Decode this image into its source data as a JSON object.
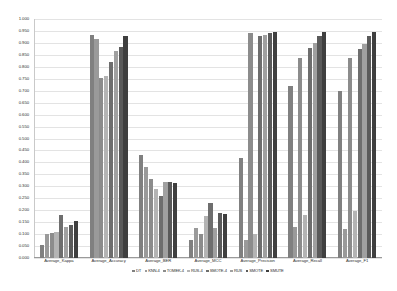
{
  "chart_data": {
    "type": "bar",
    "title": "",
    "subtitle": "",
    "xlabel": "",
    "ylabel": "",
    "ylim": [
      0.0,
      1.0
    ],
    "grid": true,
    "legend_position": "bottom",
    "categories": [
      "Average_Kappa",
      "Average_Accuracy",
      "Average_BER",
      "Average_MCC",
      "Average_Precision",
      "Average_Recall",
      "Average_F1"
    ],
    "y_ticks": [
      "0.000",
      "0.050",
      "0.100",
      "0.150",
      "0.200",
      "0.250",
      "0.300",
      "0.350",
      "0.400",
      "0.450",
      "0.500",
      "0.550",
      "0.600",
      "0.650",
      "0.700",
      "0.750",
      "0.800",
      "0.850",
      "0.900",
      "0.950",
      "1.000"
    ],
    "series": [
      {
        "name": "DT",
        "color": "#808080",
        "values": [
          0.055,
          0.935,
          0.43,
          0.075,
          0.42,
          0.72,
          0.7
        ]
      },
      {
        "name": "KNN-4",
        "color": "#9a9a9a",
        "values": [
          0.1,
          0.915,
          0.38,
          0.125,
          0.075,
          0.13,
          0.12
        ]
      },
      {
        "name": "TOMEK-4",
        "color": "#8c8c8c",
        "values": [
          0.105,
          0.755,
          0.33,
          0.1,
          0.94,
          0.835,
          0.835
        ]
      },
      {
        "name": "RUS-4",
        "color": "#b4b4b4",
        "values": [
          0.11,
          0.76,
          0.29,
          0.175,
          0.1,
          0.18,
          0.195
        ]
      },
      {
        "name": "SMOTE-4",
        "color": "#6e6e6e",
        "values": [
          0.18,
          0.82,
          0.26,
          0.23,
          0.93,
          0.88,
          0.875
        ]
      },
      {
        "name": "RUS",
        "color": "#a0a0a0",
        "values": [
          0.13,
          0.865,
          0.32,
          0.125,
          0.935,
          0.9,
          0.895
        ]
      },
      {
        "name": "SMOTE",
        "color": "#5a5a5a",
        "values": [
          0.14,
          0.885,
          0.32,
          0.19,
          0.94,
          0.93,
          0.93
        ]
      },
      {
        "name": "SMUTE",
        "color": "#3f3f3f",
        "values": [
          0.155,
          0.93,
          0.315,
          0.185,
          0.945,
          0.945,
          0.945
        ]
      }
    ]
  }
}
